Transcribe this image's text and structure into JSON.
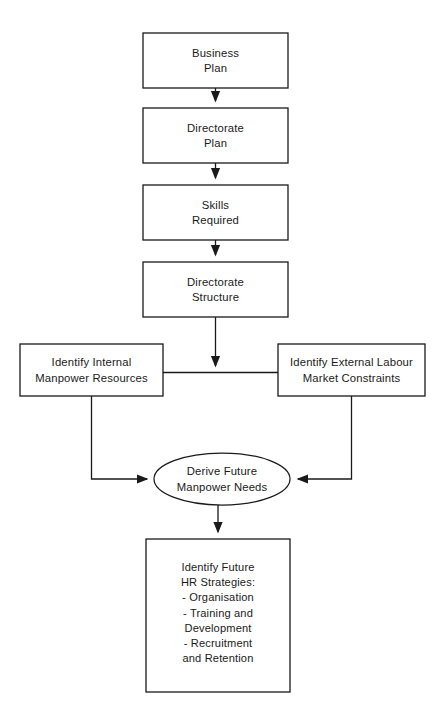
{
  "diagram": {
    "type": "flowchart",
    "background_color": "#ffffff",
    "line_color": "#1a1a1a",
    "text_color": "#1a1a1a",
    "nodes": [
      {
        "id": "business-plan",
        "shape": "rectangle",
        "lines": [
          "Business",
          "Plan"
        ],
        "x": 143,
        "y": 33,
        "w": 145,
        "h": 55
      },
      {
        "id": "directorate-plan",
        "shape": "rectangle",
        "lines": [
          "Directorate",
          "Plan"
        ],
        "x": 143,
        "y": 108,
        "w": 145,
        "h": 55
      },
      {
        "id": "skills-required",
        "shape": "rectangle",
        "lines": [
          "Skills",
          "Required"
        ],
        "x": 143,
        "y": 185,
        "w": 145,
        "h": 55
      },
      {
        "id": "directorate-structure",
        "shape": "rectangle",
        "lines": [
          "Directorate",
          "Structure"
        ],
        "x": 143,
        "y": 262,
        "w": 145,
        "h": 55
      },
      {
        "id": "identify-internal-manpower-resources",
        "shape": "rectangle",
        "lines": [
          "Identify Internal",
          "Manpower Resources"
        ],
        "x": 20,
        "y": 344,
        "w": 143,
        "h": 52
      },
      {
        "id": "identify-external-labour-market-constraints",
        "shape": "rectangle",
        "lines": [
          "Identify External Labour",
          "Market Constraints"
        ],
        "x": 278,
        "y": 344,
        "w": 147,
        "h": 52
      },
      {
        "id": "derive-future-manpower-needs",
        "shape": "ellipse",
        "lines": [
          "Derive Future",
          "Manpower Needs"
        ],
        "cx": 222,
        "cy": 479,
        "rx": 68,
        "ry": 26
      },
      {
        "id": "identify-future-hr-strategies",
        "shape": "rectangle",
        "lines": [
          "Identify Future",
          "HR Strategies:",
          "- Organisation",
          "- Training and",
          "Development",
          "- Recruitment",
          "and Retention"
        ],
        "x": 146,
        "y": 539,
        "w": 144,
        "h": 153
      }
    ],
    "edges": [
      {
        "id": "business-plan-to-directorate-plan",
        "from": "business-plan",
        "to": "directorate-plan",
        "arrowhead": true,
        "path": "M 215.5 88 L 215.5 101"
      },
      {
        "id": "directorate-plan-to-skills-required",
        "from": "directorate-plan",
        "to": "skills-required",
        "arrowhead": true,
        "path": "M 215.5 163 L 215.5 178"
      },
      {
        "id": "skills-required-to-directorate-structure",
        "from": "skills-required",
        "to": "directorate-structure",
        "arrowhead": true,
        "path": "M 215.5 240 L 215.5 255"
      },
      {
        "id": "directorate-structure-to-connector",
        "from": "directorate-structure",
        "to": "side-connector",
        "arrowhead": true,
        "path": "M 215.5 317 L 215.5 366"
      },
      {
        "id": "internal-to-external-connector",
        "from": "identify-internal-manpower-resources",
        "to": "identify-external-labour-market-constraints",
        "arrowhead": false,
        "path": "M 163 372.5 L 278 372.5"
      },
      {
        "id": "internal-to-derive",
        "from": "identify-internal-manpower-resources",
        "to": "derive-future-manpower-needs",
        "arrowhead": true,
        "path": "M 91.5 396 L 91.5 479 L 147 479"
      },
      {
        "id": "external-to-derive",
        "from": "identify-external-labour-market-constraints",
        "to": "derive-future-manpower-needs",
        "arrowhead": true,
        "path": "M 351.5 396 L 351.5 479 L 298 479"
      },
      {
        "id": "derive-to-hr-strategies",
        "from": "derive-future-manpower-needs",
        "to": "identify-future-hr-strategies",
        "arrowhead": true,
        "path": "M 218 505 L 218 532"
      }
    ]
  }
}
